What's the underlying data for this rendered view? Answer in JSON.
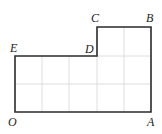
{
  "diagram": {
    "type": "grid-polygon",
    "grid": {
      "cols": 5,
      "rows": 3,
      "color": "#d6d6d6"
    },
    "outline_color": "#2a2a2a",
    "vertices": [
      {
        "label": "O",
        "gx": 0,
        "gy": 0
      },
      {
        "label": "A",
        "gx": 5,
        "gy": 0
      },
      {
        "label": "B",
        "gx": 5,
        "gy": 3
      },
      {
        "label": "C",
        "gx": 3,
        "gy": 3
      },
      {
        "label": "D",
        "gx": 3,
        "gy": 2
      },
      {
        "label": "E",
        "gx": 0,
        "gy": 2
      }
    ]
  }
}
